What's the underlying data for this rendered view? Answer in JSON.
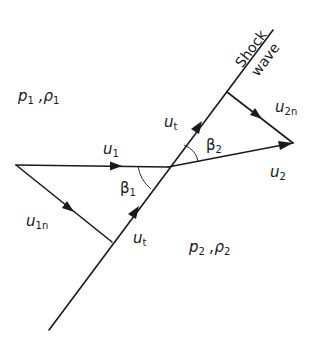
{
  "diagram": {
    "labels": {
      "shock_line1": "Shock",
      "shock_line2": "wave",
      "region1_p": "p",
      "region1_p_sub": "1",
      "region1_sep": " ,",
      "region1_rho": "ρ",
      "region1_rho_sub": "1",
      "region2_p": "p",
      "region2_p_sub": "2",
      "region2_sep": " ,",
      "region2_rho": "ρ",
      "region2_rho_sub": "2",
      "u1": "u",
      "u1_sub": "1",
      "u1n": "u",
      "u1n_sub": "1n",
      "ut_lower": "u",
      "ut_lower_sub": "t",
      "ut_upper": "u",
      "ut_upper_sub": "t",
      "u2": "u",
      "u2_sub": "2",
      "u2n": "u",
      "u2n_sub": "2n",
      "beta1": "β",
      "beta1_sub": "1",
      "beta2": "β",
      "beta2_sub": "2"
    },
    "colors": {
      "ink": "#1a1a1a",
      "background": "#ffffff"
    }
  }
}
